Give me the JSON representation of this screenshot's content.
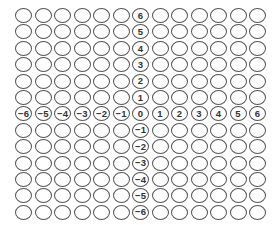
{
  "grid": {
    "rows": 13,
    "cols": 13,
    "circle_border_color": "#555555",
    "label_color": "#333333",
    "x_axis_labels": [
      "-6",
      "-5",
      "-4",
      "-3",
      "-2",
      "-1",
      "0",
      "1",
      "2",
      "3",
      "4",
      "5",
      "6"
    ],
    "y_axis_labels": [
      "6",
      "5",
      "4",
      "3",
      "2",
      "1",
      "0",
      "-1",
      "-2",
      "-3",
      "-4",
      "-5",
      "-6"
    ],
    "axis_row_index": 6,
    "axis_col_index": 6
  }
}
